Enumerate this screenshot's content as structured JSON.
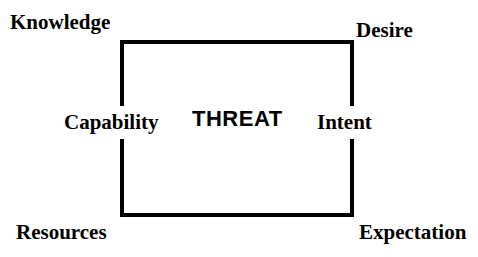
{
  "diagram": {
    "title": "THREAT",
    "center_label": "THREAT",
    "colors": {
      "ink": "#000000",
      "background": "#ffffff"
    },
    "box": {
      "stroke_width_px": 4,
      "stroke_color": "#000000"
    },
    "corner_labels": [
      {
        "id": "knowledge",
        "text": "Knowledge",
        "position": "top-left"
      },
      {
        "id": "desire",
        "text": "Desire",
        "position": "top-right"
      },
      {
        "id": "resources",
        "text": "Resources",
        "position": "bottom-left"
      },
      {
        "id": "expectation",
        "text": "Expectation",
        "position": "bottom-right"
      }
    ],
    "edge_labels": [
      {
        "id": "capability",
        "text": "Capability",
        "position": "left-middle"
      },
      {
        "id": "intent",
        "text": "Intent",
        "position": "right-middle"
      }
    ]
  }
}
